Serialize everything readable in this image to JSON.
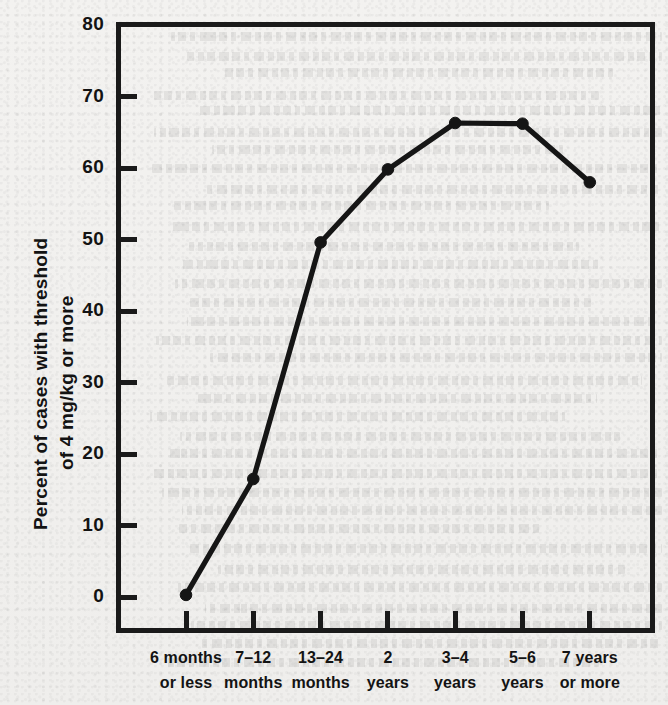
{
  "chart_data": {
    "type": "line",
    "title": "",
    "xlabel": "",
    "ylabel": "Percent of cases with threshold of 4 mg/kg or more",
    "ylabel_lines": [
      "Percent of cases with threshold",
      "of 4 mg/kg or more"
    ],
    "categories": [
      "6 months or less",
      "7–12 months",
      "13–24 months",
      "2 years",
      "3–4 years",
      "5–6 years",
      "7 years or more"
    ],
    "category_lines": [
      [
        "6 months",
        "or less"
      ],
      [
        "7–12",
        "months"
      ],
      [
        "13–24",
        "months"
      ],
      [
        "2",
        "years"
      ],
      [
        "3–4",
        "years"
      ],
      [
        "5–6",
        "years"
      ],
      [
        "7 years",
        "or more"
      ]
    ],
    "values": [
      0.3,
      16.5,
      49.6,
      59.8,
      66.3,
      66.2,
      58.0
    ],
    "ylim": [
      0,
      80
    ],
    "yticks": [
      0,
      10,
      20,
      30,
      40,
      50,
      60,
      70,
      80
    ],
    "ytick_labels": [
      "0",
      "10",
      "20",
      "30",
      "40",
      "50",
      "60",
      "70",
      "80"
    ],
    "grid": false,
    "legend": false,
    "marker": "filled-circle",
    "line_color": "#151515",
    "axis_color": "#1a1a1a",
    "background_color": "#f2f1ef"
  }
}
